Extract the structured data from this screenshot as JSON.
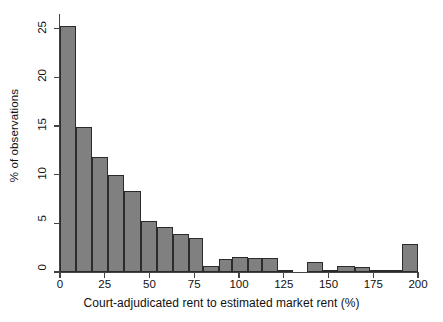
{
  "figure": {
    "background_color": "#ffffff",
    "bar_fill_color": "#808080",
    "bar_edge_color": "#2b2b2b",
    "axis_color": "#444444"
  },
  "chart_data": {
    "type": "bar",
    "title": "",
    "subtitle": "",
    "xlabel": "Court-adjudicated rent to estimated market rent (%)",
    "ylabel": "% of observations",
    "xlim": [
      0,
      200
    ],
    "ylim": [
      0,
      26.5
    ],
    "xticks": [
      0,
      25,
      50,
      75,
      100,
      125,
      150,
      175,
      200
    ],
    "xtick_labels": [
      "0",
      "25",
      "50",
      "75",
      "100",
      "125",
      "150",
      "175",
      "200"
    ],
    "yticks": [
      0,
      5,
      10,
      15,
      20,
      25
    ],
    "ytick_labels": [
      "0",
      "5",
      "10",
      "15",
      "20",
      "25"
    ],
    "grid": false,
    "legend": null,
    "bin_width": 10,
    "bins": [
      {
        "x0": 0,
        "x1": 9,
        "value": 25.3
      },
      {
        "x0": 9,
        "x1": 18,
        "value": 14.9
      },
      {
        "x0": 18,
        "x1": 27,
        "value": 11.8
      },
      {
        "x0": 27,
        "x1": 36,
        "value": 10.0
      },
      {
        "x0": 36,
        "x1": 45,
        "value": 8.3
      },
      {
        "x0": 45,
        "x1": 54,
        "value": 5.25
      },
      {
        "x0": 54,
        "x1": 63,
        "value": 4.6
      },
      {
        "x0": 63,
        "x1": 72,
        "value": 3.9
      },
      {
        "x0": 72,
        "x1": 80,
        "value": 3.5
      },
      {
        "x0": 80,
        "x1": 89,
        "value": 0.6
      },
      {
        "x0": 89,
        "x1": 96,
        "value": 1.3
      },
      {
        "x0": 96,
        "x1": 105,
        "value": 1.5
      },
      {
        "x0": 105,
        "x1": 113,
        "value": 1.4
      },
      {
        "x0": 113,
        "x1": 122,
        "value": 1.4
      },
      {
        "x0": 122,
        "x1": 130,
        "value": 0.12
      },
      {
        "x0": 138,
        "x1": 147,
        "value": 1.0
      },
      {
        "x0": 147,
        "x1": 155,
        "value": 0.1
      },
      {
        "x0": 155,
        "x1": 165,
        "value": 0.6
      },
      {
        "x0": 165,
        "x1": 173,
        "value": 0.5
      },
      {
        "x0": 173,
        "x1": 191,
        "value": 0.12
      },
      {
        "x0": 191,
        "x1": 200,
        "value": 2.9
      }
    ]
  }
}
